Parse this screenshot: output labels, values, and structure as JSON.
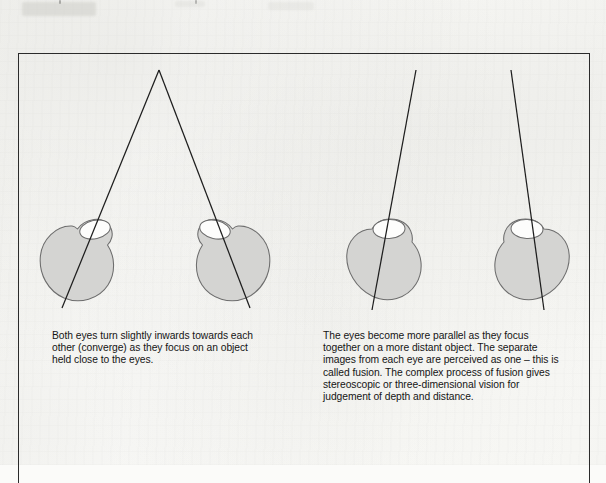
{
  "figure": {
    "kind": "anatomical-diagram",
    "panels": [
      {
        "id": "near-object",
        "name": "convergence-panel",
        "caption": "Both eyes turn slightly inwards towards each\nother (converge) as they focus on an object\nheld close to the eyes.",
        "eyes": [
          {
            "name": "left-eye",
            "cornea_side": "right"
          },
          {
            "name": "right-eye",
            "cornea_side": "left"
          }
        ],
        "sight_lines": "converging to a single near point"
      },
      {
        "id": "distant-object",
        "name": "fusion-panel",
        "caption": "The eyes become more parallel as they focus\ntogether on a more distant object. The separate\nimages from each eye are perceived as one – this is\ncalled fusion. The complex process of fusion gives\nstereoscopic or three-dimensional vision for\njudgement of depth and distance.",
        "eyes": [
          {
            "name": "left-eye",
            "cornea_side": "center"
          },
          {
            "name": "right-eye",
            "cornea_side": "center"
          }
        ],
        "sight_lines": "nearly parallel"
      }
    ]
  },
  "colors": {
    "paper": "#fcfcfa",
    "ink": "#1b1b1b",
    "frame": "#2b2b2b",
    "eye_fill": "#d4d4d2",
    "eye_outline": "#6d6d6d",
    "cornea_fill": "#fdfdfc",
    "sight_line": "#1e1e1e"
  },
  "geometry": {
    "frame": {
      "x": 18,
      "y": 53,
      "w": 572,
      "h": 430
    },
    "eyes": [
      {
        "cx": 78,
        "cy": 262,
        "r": 38,
        "cornea_dx": 18,
        "cornea_dy": -34,
        "cornea_rot": -16
      },
      {
        "cx": 232,
        "cy": 262,
        "r": 38,
        "cornea_dx": -18,
        "cornea_dy": -34,
        "cornea_rot": 16
      },
      {
        "cx": 385,
        "cy": 262,
        "r": 38,
        "cornea_dx": 2,
        "cornea_dy": -36,
        "cornea_rot": 0
      },
      {
        "cx": 531,
        "cy": 262,
        "r": 38,
        "cornea_dx": -2,
        "cornea_dy": -36,
        "cornea_rot": 0
      }
    ],
    "sight_lines": [
      {
        "x1": 159,
        "y1": 70,
        "x2": 62,
        "y2": 308
      },
      {
        "x1": 159,
        "y1": 70,
        "x2": 250,
        "y2": 308
      },
      {
        "x1": 416,
        "y1": 70,
        "x2": 372,
        "y2": 310
      },
      {
        "x1": 511,
        "y1": 70,
        "x2": 544,
        "y2": 310
      }
    ]
  }
}
